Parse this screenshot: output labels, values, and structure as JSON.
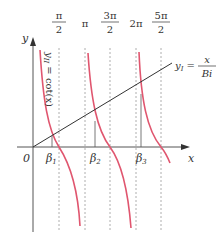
{
  "diagram": {
    "axes": {
      "x_label": "x",
      "y_label": "y",
      "origin_label": "0"
    },
    "top_ticks": [
      {
        "num": "π",
        "den": "2",
        "value": "π/2"
      },
      {
        "single": "π",
        "value": "π"
      },
      {
        "num": "3π",
        "den": "2",
        "value": "3π/2"
      },
      {
        "single": "2π",
        "value": "2π"
      },
      {
        "num": "5π",
        "den": "2",
        "value": "5π/2"
      }
    ],
    "roots": [
      "β",
      "β",
      "β"
    ],
    "root_subscripts": [
      "1",
      "2",
      "3"
    ],
    "curve_cot": {
      "label_prefix": "y",
      "label_sub": "II",
      "label_rest": " = cot(x)",
      "color": "#e0566f"
    },
    "line": {
      "label_prefix": "y",
      "label_sub": "I",
      "label_eq": " = ",
      "num": "x",
      "den": "Bi",
      "color": "#333333"
    },
    "colors": {
      "axis": "#555555",
      "dashed": "#999999",
      "curve": "#e0566f",
      "line": "#333333"
    }
  }
}
